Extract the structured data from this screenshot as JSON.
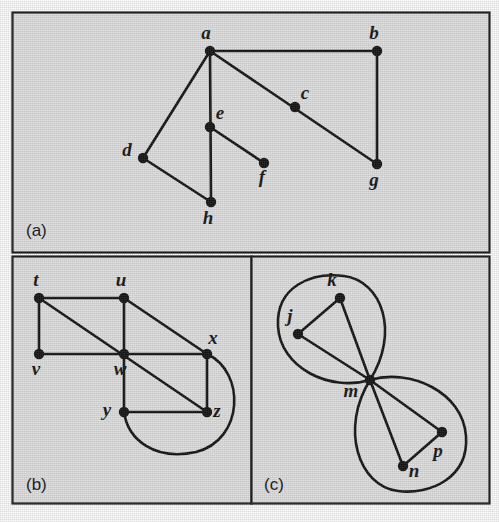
{
  "figure": {
    "background_color": "#e2e2e2",
    "ink_color": "#111111",
    "frame_color": "#1a1a1a",
    "panel_labels": {
      "a": "(a)",
      "b": "(b)",
      "c": "(c)"
    }
  },
  "chart_data": {
    "type": "diagram",
    "title": "",
    "subtitle": "",
    "xlabel": "",
    "ylabel": "",
    "grid": false,
    "legend_position": "none",
    "diagram_kind": "undirected-graph-triptych",
    "panels": [
      {
        "id": "a",
        "label": "(a)",
        "label_pos": [
          26,
          236
        ],
        "frame": [
          12,
          12,
          477,
          240
        ],
        "nodes": [
          {
            "id": "a",
            "x": 210,
            "y": 51,
            "label": "a",
            "label_dx": -4,
            "label_dy": -12
          },
          {
            "id": "b",
            "x": 377,
            "y": 51,
            "label": "b",
            "label_dx": -3,
            "label_dy": -12
          },
          {
            "id": "c",
            "x": 295,
            "y": 107,
            "label": "c",
            "label_dx": 10,
            "label_dy": -8
          },
          {
            "id": "d",
            "x": 143,
            "y": 158,
            "label": "d",
            "label_dx": -16,
            "label_dy": -2
          },
          {
            "id": "e",
            "x": 210,
            "y": 127,
            "label": "e",
            "label_dx": 10,
            "label_dy": -8
          },
          {
            "id": "f",
            "x": 264,
            "y": 163,
            "label": "f",
            "label_dx": -2,
            "label_dy": 20
          },
          {
            "id": "g",
            "x": 377,
            "y": 164,
            "label": "g",
            "label_dx": -3,
            "label_dy": 22
          },
          {
            "id": "h",
            "x": 211,
            "y": 202,
            "label": "h",
            "label_dx": -3,
            "label_dy": 22
          }
        ],
        "edges": [
          [
            "a",
            "b"
          ],
          [
            "a",
            "d"
          ],
          [
            "a",
            "h"
          ],
          [
            "a",
            "g"
          ],
          [
            "b",
            "g"
          ],
          [
            "d",
            "h"
          ],
          [
            "e",
            "f"
          ]
        ],
        "curved_edges": []
      },
      {
        "id": "b",
        "label": "(b)",
        "label_pos": [
          26,
          490
        ],
        "frame": [
          12,
          256,
          239,
          247
        ],
        "nodes": [
          {
            "id": "t",
            "x": 39,
            "y": 298,
            "label": "t",
            "label_dx": -3,
            "label_dy": -12
          },
          {
            "id": "u",
            "x": 124,
            "y": 298,
            "label": "u",
            "label_dx": -3,
            "label_dy": -12
          },
          {
            "id": "v",
            "x": 39,
            "y": 354,
            "label": "v",
            "label_dx": -3,
            "label_dy": 21
          },
          {
            "id": "w",
            "x": 124,
            "y": 354,
            "label": "w",
            "label_dx": -4,
            "label_dy": 21
          },
          {
            "id": "x",
            "x": 207,
            "y": 354,
            "label": "x",
            "label_dx": 6,
            "label_dy": -10
          },
          {
            "id": "y",
            "x": 124,
            "y": 412,
            "label": "y",
            "label_dx": -17,
            "label_dy": 4
          },
          {
            "id": "z",
            "x": 207,
            "y": 412,
            "label": "z",
            "label_dx": 10,
            "label_dy": 5
          }
        ],
        "edges": [
          [
            "t",
            "u"
          ],
          [
            "t",
            "v"
          ],
          [
            "t",
            "z"
          ],
          [
            "u",
            "w"
          ],
          [
            "u",
            "x"
          ],
          [
            "v",
            "w"
          ],
          [
            "w",
            "x"
          ],
          [
            "w",
            "y"
          ],
          [
            "x",
            "z"
          ],
          [
            "y",
            "z"
          ]
        ],
        "curved_edges": [
          {
            "from": "x",
            "to": "y",
            "path": "M 207 354 C 246 372 244 440 196 452 C 155 461 128 440 124 412"
          }
        ]
      },
      {
        "id": "c",
        "label": "(c)",
        "label_pos": [
          264,
          490
        ],
        "frame": [
          251,
          256,
          238,
          247
        ],
        "nodes": [
          {
            "id": "j",
            "x": 298,
            "y": 334,
            "label": "j",
            "label_dx": -8,
            "label_dy": -12
          },
          {
            "id": "k",
            "x": 340,
            "y": 298,
            "label": "k",
            "label_dx": -8,
            "label_dy": -12
          },
          {
            "id": "m",
            "x": 370,
            "y": 380,
            "label": "m",
            "label_dx": -19,
            "label_dy": 17
          },
          {
            "id": "n",
            "x": 403,
            "y": 466,
            "label": "n",
            "label_dx": 11,
            "label_dy": 11
          },
          {
            "id": "p",
            "x": 442,
            "y": 432,
            "label": "p",
            "label_dx": -4,
            "label_dy": 25
          }
        ],
        "edges": [
          [
            "j",
            "k"
          ],
          [
            "j",
            "m"
          ],
          [
            "k",
            "m"
          ],
          [
            "m",
            "n"
          ],
          [
            "m",
            "p"
          ],
          [
            "n",
            "p"
          ]
        ],
        "curved_edges": [
          {
            "from": "m",
            "to": "m",
            "path": "M 370 380 C 330 392 280 368 278 326 C 276 286 312 272 344 276 C 382 281 400 332 370 380 Z"
          },
          {
            "from": "m",
            "to": "m",
            "path": "M 370 380 C 410 368 463 392 466 436 C 469 478 430 495 398 491 C 358 486 340 428 370 380 Z"
          }
        ]
      }
    ]
  }
}
